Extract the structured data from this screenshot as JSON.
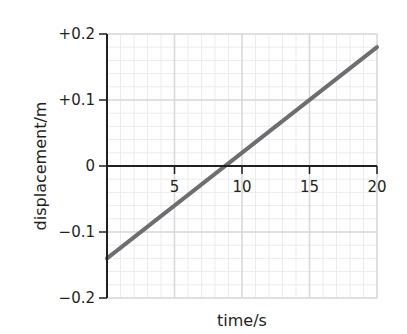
{
  "chart_data": {
    "type": "line",
    "title": "",
    "xlabel": "time/s",
    "ylabel": "displacement/m",
    "xlim": [
      0,
      20
    ],
    "ylim": [
      -0.2,
      0.2
    ],
    "x_ticks": [
      5,
      10,
      15,
      20
    ],
    "x_tick_labels": [
      "5",
      "10",
      "15",
      "20"
    ],
    "y_ticks": [
      0.2,
      0.1,
      0,
      -0.1,
      -0.2
    ],
    "y_tick_labels": [
      "+0.2",
      "+0.1",
      "0",
      "−0.1",
      "−0.2"
    ],
    "grid": true,
    "minor_grid_x_step": 1,
    "minor_grid_y_step": 0.02,
    "legend": null,
    "series": [
      {
        "name": "displacement",
        "color": "#6d6e71",
        "x": [
          0,
          20
        ],
        "values": [
          -0.14,
          0.18
        ]
      }
    ],
    "annotations": []
  },
  "colors": {
    "axis": "#231f20",
    "major_grid": "#d8d8d8",
    "minor_grid": "#ececec",
    "line": "#6d6e71"
  }
}
